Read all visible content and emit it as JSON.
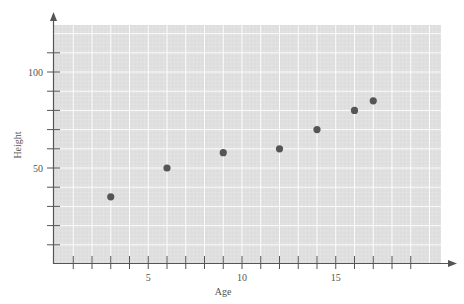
{
  "chart_data": {
    "type": "scatter",
    "title": "",
    "xlabel": "Age",
    "ylabel": "Height",
    "xlim": [
      0,
      20.8
    ],
    "ylim": [
      0,
      124
    ],
    "x_ticks": [
      1,
      2,
      3,
      4,
      5,
      6,
      7,
      8,
      9,
      10,
      11,
      12,
      13,
      14,
      15,
      16,
      17,
      18,
      19
    ],
    "x_tick_labels": {
      "5": "5",
      "10": "10",
      "15": "15"
    },
    "y_ticks": [
      10,
      20,
      30,
      40,
      50,
      60,
      70,
      80,
      90,
      100,
      110
    ],
    "y_tick_labels": {
      "50": "50",
      "100": "100"
    },
    "grid": true,
    "legend": null,
    "series": [
      {
        "name": "Height vs Age",
        "color": "#555555",
        "points": [
          {
            "x": 3,
            "y": 35
          },
          {
            "x": 6,
            "y": 50
          },
          {
            "x": 9,
            "y": 58
          },
          {
            "x": 12,
            "y": 60
          },
          {
            "x": 14,
            "y": 70
          },
          {
            "x": 16,
            "y": 80
          },
          {
            "x": 17,
            "y": 85
          }
        ]
      }
    ]
  },
  "colors": {
    "plot_background": "#dddddd",
    "grid_line": "#ffffff",
    "axis": "#555555",
    "point": "#555555"
  }
}
